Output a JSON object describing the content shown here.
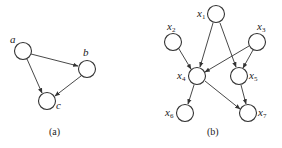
{
  "figure": {
    "panels": [
      {
        "caption": "(a)",
        "nodes": [
          {
            "id": "a",
            "label": "a",
            "x": 23,
            "y": 51
          },
          {
            "id": "b",
            "label": "b",
            "x": 87,
            "y": 69
          },
          {
            "id": "c",
            "label": "c",
            "x": 47,
            "y": 101
          }
        ],
        "edges": [
          {
            "from": "a",
            "to": "b"
          },
          {
            "from": "a",
            "to": "c"
          },
          {
            "from": "b",
            "to": "c"
          }
        ]
      },
      {
        "caption": "(b)",
        "nodes": [
          {
            "id": "x1",
            "label": "x",
            "sub": "1",
            "x": 216,
            "y": 14
          },
          {
            "id": "x2",
            "label": "x",
            "sub": "2",
            "x": 173,
            "y": 42
          },
          {
            "id": "x3",
            "label": "x",
            "sub": "3",
            "x": 257,
            "y": 42
          },
          {
            "id": "x4",
            "label": "x",
            "sub": "4",
            "x": 197,
            "y": 76
          },
          {
            "id": "x5",
            "label": "x",
            "sub": "5",
            "x": 239,
            "y": 76
          },
          {
            "id": "x6",
            "label": "x",
            "sub": "6",
            "x": 185,
            "y": 113
          },
          {
            "id": "x7",
            "label": "x",
            "sub": "7",
            "x": 248,
            "y": 113
          }
        ],
        "edges": [
          {
            "from": "x1",
            "to": "x4"
          },
          {
            "from": "x1",
            "to": "x5"
          },
          {
            "from": "x2",
            "to": "x4"
          },
          {
            "from": "x3",
            "to": "x4"
          },
          {
            "from": "x3",
            "to": "x5"
          },
          {
            "from": "x4",
            "to": "x6"
          },
          {
            "from": "x4",
            "to": "x7"
          },
          {
            "from": "x5",
            "to": "x7"
          }
        ]
      }
    ]
  }
}
